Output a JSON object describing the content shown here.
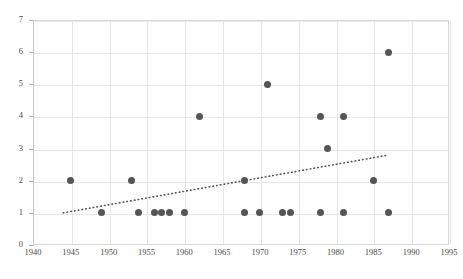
{
  "chart_data": {
    "type": "scatter",
    "title": "",
    "xlabel": "",
    "ylabel": "",
    "xlim": [
      1940,
      1995
    ],
    "ylim": [
      0,
      7
    ],
    "grid": true,
    "legend": null,
    "xticks": [
      1940,
      1945,
      1950,
      1955,
      1960,
      1965,
      1970,
      1975,
      1980,
      1985,
      1990,
      1995
    ],
    "yticks": [
      0,
      1,
      2,
      3,
      4,
      5,
      6,
      7
    ],
    "xtick_labels": [
      "1940",
      "1945",
      "1950",
      "1955",
      "1960",
      "1965",
      "1970",
      "1975",
      "1980",
      "1985",
      "1990",
      "1995"
    ],
    "ytick_labels": [
      "0",
      "1",
      "2",
      "3",
      "4",
      "5",
      "6",
      "7"
    ],
    "marker_color": "#555555",
    "gridline_color": "#e6e6e6",
    "points": [
      {
        "x": 1945,
        "y": 2
      },
      {
        "x": 1949,
        "y": 1
      },
      {
        "x": 1953,
        "y": 2
      },
      {
        "x": 1954,
        "y": 1
      },
      {
        "x": 1956,
        "y": 1
      },
      {
        "x": 1957,
        "y": 1
      },
      {
        "x": 1958,
        "y": 1
      },
      {
        "x": 1960,
        "y": 1
      },
      {
        "x": 1962,
        "y": 4
      },
      {
        "x": 1968,
        "y": 2
      },
      {
        "x": 1968,
        "y": 1
      },
      {
        "x": 1970,
        "y": 1
      },
      {
        "x": 1971,
        "y": 5
      },
      {
        "x": 1973,
        "y": 1
      },
      {
        "x": 1974,
        "y": 1
      },
      {
        "x": 1978,
        "y": 4
      },
      {
        "x": 1978,
        "y": 1
      },
      {
        "x": 1979,
        "y": 3
      },
      {
        "x": 1981,
        "y": 4
      },
      {
        "x": 1981,
        "y": 1
      },
      {
        "x": 1985,
        "y": 2
      },
      {
        "x": 1987,
        "y": 6
      },
      {
        "x": 1987,
        "y": 1
      }
    ],
    "trendline": {
      "style": "dotted",
      "color": "#555555",
      "x_start": 1944,
      "y_start": 1.0,
      "x_end": 1987,
      "y_end": 2.8
    }
  }
}
